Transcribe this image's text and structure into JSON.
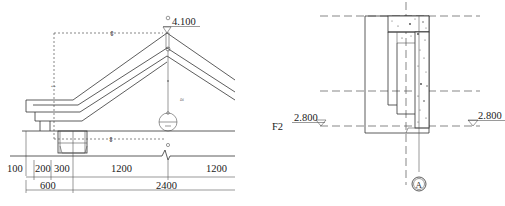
{
  "drawing": {
    "left_detail": {
      "ridge_elevation": "4.100",
      "dimensions_row1": [
        "100",
        "200",
        "300",
        "1200",
        "1200"
      ],
      "dimensions_row2": [
        "600",
        "2400"
      ]
    },
    "right_detail": {
      "floor_label": "F2",
      "left_elevation": "2.800",
      "right_elevation": "2.800",
      "axis_label": "A"
    }
  }
}
